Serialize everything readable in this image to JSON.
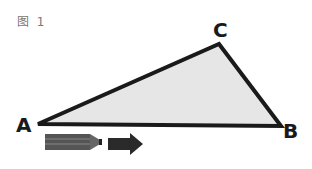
{
  "figure": {
    "label": "图 1",
    "vertices": {
      "A": "A",
      "B": "B",
      "C": "C"
    },
    "fill_color": "#e6e6e6",
    "stroke_color": "#1a1a1a"
  },
  "icons": [
    "pencil-icon",
    "arrow-right-icon"
  ]
}
